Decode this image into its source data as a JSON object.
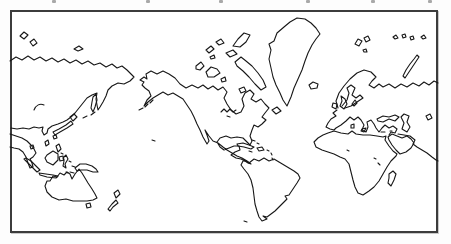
{
  "figure": {
    "background_color": "#fdfdfd",
    "frame": {
      "border_color": "#3c3c3c",
      "fill_color": "#ffffff"
    },
    "top_crop_marks": {
      "comment_color": "#a8a8a8",
      "color": "#a8a8a8",
      "positions_x": [
        52,
        146,
        219,
        306,
        371,
        428
      ]
    },
    "map": {
      "stroke_color": "#171717",
      "stroke_width": 1.1,
      "landmasses": [
        {
          "name": "asia-north-coast-mainland",
          "d": "M 10,61 L 16,57 L 22,60 L 28,56 L 34,60 L 40,57 L 46,61 L 52,58 L 58,62 L 64,59 L 70,63 L 76,60 L 82,64 L 88,61 L 94,65 L 100,63 L 106,67 L 112,64 L 117,68 L 122,66 L 127,70 L 131,74 L 134,77 L 130,81 L 124,84 L 118,83 L 112,86 L 108,90 L 106,96 L 103,102 L 100,107 L 98,110 L 97,105 L 96,99 L 97,93 L 92,95 L 87,98 L 83,103 L 79,108 L 75,113 L 71,117 L 67,120 L 63,122 L 58,124 L 52,126 L 48,129 L 47,133 L 44,135 L 42,131 L 43,127 L 39,128 L 34,127 L 29,129 L 23,128 L 17,129 L 11,128"
        },
        {
          "name": "southeast-asia-coast",
          "d": "M 10,134 L 16,136 L 22,138 L 27,141 L 31,145 L 34,149 L 36,153 L 33,157 L 30,159 L 32,163 L 33,167 L 30,168 L 28,163 L 26,157 L 23,152 L 19,149 L 14,148 L 10,147"
        },
        {
          "name": "wrangel-island-west",
          "d": "M 20,36 L 24,32 L 28,35 L 24,39 Z"
        },
        {
          "name": "wrangel-island-east",
          "d": "M 30,42 L 34,39 L 37,43 L 33,46 Z"
        },
        {
          "name": "new-siberian-islands",
          "d": "M 74,49 L 79,46 L 83,49 L 78,51 Z"
        },
        {
          "name": "lake-baikal",
          "d": "M 34,110 C 36,105 40,103 44,105"
        },
        {
          "name": "sakhalin-island",
          "d": "M 93,97 L 96,94 L 97,100 L 95,107 L 93,112 L 91,108 L 92,102 Z"
        },
        {
          "name": "kuril-islands",
          "d": "M 95,112 L 91,115 M 87,116 L 83,118"
        },
        {
          "name": "japan-hokkaido",
          "d": "M 70,117 L 74,114 L 77,117 L 73,121 Z"
        },
        {
          "name": "japan-honshu",
          "d": "M 71,121 L 73,124 L 67,128 L 60,132 L 55,135 L 53,132 L 59,129 L 66,125 Z"
        },
        {
          "name": "japan-kyushu",
          "d": "M 53,136 L 56,135 L 57,138 L 54,139 Z"
        },
        {
          "name": "taiwan-island",
          "d": "M 45,142 L 48,140 L 49,144 L 46,146 Z"
        },
        {
          "name": "hainan-island",
          "d": "M 30,146 L 33,145 L 34,148 L 31,149 Z"
        },
        {
          "name": "philippines-luzon",
          "d": "M 56,146 L 59,144 L 61,149 L 58,152 Z"
        },
        {
          "name": "philippines-mindanao",
          "d": "M 59,157 L 63,156 L 64,160 L 60,161 Z"
        },
        {
          "name": "philippines-visayas-dot",
          "d": "M 61,153 L 63,154"
        },
        {
          "name": "borneo-island",
          "d": "M 47,155 L 53,151 L 58,154 L 58,160 L 53,165 L 47,162 L 45,158 Z"
        },
        {
          "name": "sumatra-island",
          "d": "M 26,158 L 31,161 L 36,166 L 40,170 L 37,172 L 32,167 L 27,162 L 24,159 Z"
        },
        {
          "name": "java-island",
          "d": "M 39,173 L 46,174 L 53,175 L 58,176 L 56,178 L 47,177 L 40,175 Z"
        },
        {
          "name": "sulawesi-island",
          "d": "M 63,158 L 66,155 L 68,159 L 65,164 L 66,168 L 63,166 L 64,161 Z"
        },
        {
          "name": "moluccas-timor-dots",
          "d": "M 69,161 L 71,162 M 72,166 L 75,167 M 70,172 L 74,173 M 66,172 L 68,173"
        },
        {
          "name": "new-guinea-island",
          "d": "M 75,168 L 80,164 L 86,164 L 92,166 L 96,169 L 98,172 L 93,172 L 87,170 L 81,170 L 77,171 Z"
        },
        {
          "name": "australia",
          "d": "M 50,181 L 53,176 L 57,177 L 60,173 L 64,175 L 67,172 L 70,174 L 72,179 L 75,174 L 79,169 L 82,173 L 85,178 L 88,183 L 92,189 L 95,194 L 97,198 L 93,200 L 87,201 L 80,201 L 73,201 L 66,199 L 59,200 L 52,197 L 47,192 L 45,186 L 47,181 Z"
        },
        {
          "name": "tasmania-island",
          "d": "M 86,204 L 90,203 L 91,207 L 87,208 Z"
        },
        {
          "name": "new-zealand-north-island",
          "d": "M 114,193 L 118,190 L 120,194 L 116,198 Z"
        },
        {
          "name": "new-zealand-south-island",
          "d": "M 108,209 L 112,204 L 116,200 L 118,203 L 113,207 L 110,211 Z"
        },
        {
          "name": "aleutian-islands",
          "d": "M 143,108 L 139,110 M 148,104 L 145,107 M 153,100 L 150,103"
        },
        {
          "name": "hawaii-dots",
          "d": "M 152,140 L 155,141"
        },
        {
          "name": "north-america-mainland",
          "d": "M 140,80 L 144,77 L 147,79 L 146,74 L 151,71 L 157,74 L 163,71 L 169,74 L 175,78 L 180,84 L 186,88 L 192,85 L 198,88 L 203,85 L 208,89 L 213,86 L 218,90 L 223,87 L 227,92 L 224,98 L 227,104 L 231,110 L 236,114 L 241,112 L 244,106 L 242,99 L 245,93 L 250,90 L 254,94 L 251,99 L 256,102 L 261,99 L 265,104 L 269,108 L 265,113 L 262,117 L 266,120 L 262,124 L 258,127 L 254,125 L 252,130 L 250,136 L 252,141 L 250,145 L 246,141 L 243,138 L 237,137 L 231,138 L 226,136 L 220,138 L 217,142 L 220,147 L 224,150 L 229,148 L 234,146 L 239,146 L 240,150 L 235,152 L 231,155 L 236,158 L 241,159 L 245,161 L 248,163 L 251,164 L 247,161 L 242,158 L 237,156 L 232,153 L 227,150 L 223,147 L 218,143 L 213,141 L 209,136 L 205,130 L 207,135 L 209,141 L 207,144 L 203,137 L 200,130 L 197,124 L 194,117 L 191,111 L 187,105 L 183,99 L 178,96 L 173,93 L 168,95 L 163,92 L 158,95 L 153,98 L 148,102 L 144,106 L 147,100 L 151,96 L 149,91 L 145,88 L 142,85 L 144,82 Z"
        },
        {
          "name": "great-lakes",
          "d": "M 221,112 L 224,109 L 227,112 L 230,109 L 233,112 L 236,110 M 227,116 L 230,117"
        },
        {
          "name": "banks-island",
          "d": "M 196,66 L 201,62 L 204,66 L 200,70 L 196,69 Z"
        },
        {
          "name": "victoria-island",
          "d": "M 206,72 L 211,67 L 217,69 L 220,73 L 214,77 L 208,77 Z"
        },
        {
          "name": "king-william-island",
          "d": "M 221,79 L 225,77 L 226,81 L 222,82 Z"
        },
        {
          "name": "southampton-island",
          "d": "M 239,89 L 244,87 L 246,91 L 241,93 Z"
        },
        {
          "name": "baffin-island",
          "d": "M 235,62 L 241,57 L 246,61 L 252,66 L 258,73 L 263,80 L 266,87 L 261,90 L 255,84 L 249,77 L 243,71 L 237,66 Z"
        },
        {
          "name": "devon-island",
          "d": "M 226,53 L 233,50 L 237,54 L 230,57 Z"
        },
        {
          "name": "ellesmere-island",
          "d": "M 233,46 L 238,39 L 244,33 L 250,35 L 246,42 L 240,47 Z"
        },
        {
          "name": "queen-elizabeth-islands",
          "d": "M 206,50 L 211,46 L 214,49 L 209,53 Z M 216,42 L 221,39 L 224,43 L 219,45 Z M 210,57 L 214,55 L 215,58 L 211,59 Z"
        },
        {
          "name": "greenland",
          "d": "M 287,106 L 283,100 L 280,93 L 276,85 L 273,77 L 271,68 L 269,59 L 271,50 L 269,44 L 274,41 L 277,33 L 284,27 L 290,22 L 297,18 L 305,19 L 311,23 L 316,28 L 320,34 L 316,39 L 312,45 L 308,53 L 305,61 L 302,70 L 298,79 L 294,88 L 291,97 Z"
        },
        {
          "name": "iceland",
          "d": "M 309,85 L 313,82 L 318,84 L 317,88 L 311,89 Z"
        },
        {
          "name": "newfoundland-island",
          "d": "M 272,110 L 277,107 L 281,111 L 276,114 Z"
        },
        {
          "name": "cuba",
          "d": "M 237,144 L 243,143 L 249,145 L 254,147 L 251,149 L 244,147 L 238,146 Z"
        },
        {
          "name": "hispaniola",
          "d": "M 257,148 L 262,147 L 264,150 L 259,151 Z"
        },
        {
          "name": "jamaica-dot",
          "d": "M 249,151 L 252,152"
        },
        {
          "name": "bahamas-dots",
          "d": "M 252,140 L 255,141 M 257,143 L 259,144"
        },
        {
          "name": "lesser-antilles-dots",
          "d": "M 267,150 L 269,151 M 271,153 L 272,155 M 272,158 L 273,160"
        },
        {
          "name": "south-america",
          "d": "M 249,163 L 254,159 L 259,161 L 264,158 L 269,161 L 274,159 L 279,162 L 284,165 L 289,168 L 294,171 L 298,174 L 300,178 L 297,183 L 293,189 L 289,195 L 285,196 L 287,199 L 283,203 L 279,207 L 275,211 L 271,214 L 267,217 L 263,216 L 267,219 L 262,221 L 259,217 L 257,211 L 255,204 L 254,196 L 253,188 L 251,180 L 248,174 L 244,169 L 241,165 L 243,161 L 246,161 Z"
        },
        {
          "name": "falkland-dot",
          "d": "M 244,221 L 247,222"
        },
        {
          "name": "svalbard-islands",
          "d": "M 355,44 L 358,39 L 362,41 L 359,46 Z M 364,38 L 368,36 L 370,40 L 366,42 Z M 363,50 L 366,49 L 367,52 L 364,52 Z"
        },
        {
          "name": "franz-josef-land-dots",
          "d": "M 393,37 L 396,35 L 398,38 L 395,39 Z M 402,35 L 405,34 L 406,37 L 403,38 Z M 410,37 L 413,36 L 414,39 L 411,40 Z"
        },
        {
          "name": "severnaya-zemlya-dots",
          "d": "M 421,37 L 424,35 L 426,38 L 423,39 Z"
        },
        {
          "name": "novaya-zemlya",
          "d": "M 403,76 L 406,70 L 410,64 L 414,59 L 417,55 L 419,57 L 415,63 L 411,69 L 407,75 L 405,78 Z"
        },
        {
          "name": "scandinavia-russia-north-coast",
          "d": "M 338,108 L 336,101 L 339,93 L 344,86 L 350,79 L 357,73 L 364,70 L 371,72 L 376,77 L 372,81 L 369,85 L 374,88 L 379,84 L 383,87 L 389,84 L 395,88 L 401,84 L 407,87 L 413,83 L 419,86 L 424,82 L 429,85 L 434,81 L 438,83"
        },
        {
          "name": "baltic-sea",
          "d": "M 342,106 L 347,100 L 349,93 L 347,88 L 351,85 L 355,88 L 352,95 L 356,98 L 360,95 L 363,98 L 357,102 L 351,106 L 345,108"
        },
        {
          "name": "denmark",
          "d": "M 352,104 L 355,100 L 357,103 L 354,106 Z"
        },
        {
          "name": "great-britain-island",
          "d": "M 341,96 L 345,99 L 347,104 L 344,109 L 340,106 L 342,101 Z"
        },
        {
          "name": "ireland-island",
          "d": "M 333,103 L 337,104 L 336,109 L 332,107 Z"
        },
        {
          "name": "europe-mediterranean-coast",
          "d": "M 337,110 L 333,113 L 336,116 L 331,119 L 328,123 L 326,127 L 330,129 L 334,130 L 336,128 L 341,125 L 346,121 L 350,117 L 354,120 L 358,117 L 361,120 L 364,125 L 362,130 L 366,132 L 368,127 L 367,122 L 371,120 L 374,124 L 376,128 L 379,132 L 382,128 L 385,125 L 389,128 L 393,126 L 397,129 L 395,133 L 391,132 L 389,135"
        },
        {
          "name": "corsica-sardinia",
          "d": "M 351,125 L 354,124 L 354,128 L 351,128 Z"
        },
        {
          "name": "sicily",
          "d": "M 362,129 L 366,128 L 364,132 L 361,131 Z"
        },
        {
          "name": "crete-cyprus-dots",
          "d": "M 381,132 L 385,132 M 390,131 L 392,131"
        },
        {
          "name": "black-sea",
          "d": "M 377,119 L 383,116 L 389,117 L 395,115 L 399,117 L 395,121 L 389,119 L 383,122 L 378,121 Z"
        },
        {
          "name": "caspian-sea",
          "d": "M 404,114 L 409,116 L 407,122 L 410,127 L 407,132 L 402,129 L 404,123 L 401,117 Z"
        },
        {
          "name": "aral-sea",
          "d": "M 426,116 L 430,114 L 432,118 L 428,120 Z"
        },
        {
          "name": "africa",
          "d": "M 334,131 L 341,133 L 348,134 L 352,131 L 356,134 L 363,135 L 370,135 L 377,136 L 383,137 L 386,136 L 385,140 L 389,146 L 393,151 L 397,154 L 396,156 L 391,161 L 387,167 L 383,174 L 379,181 L 374,187 L 369,191 L 363,195 L 358,193 L 355,187 L 353,180 L 351,172 L 349,164 L 345,159 L 340,157 L 334,154 L 328,152 L 322,150 L 316,147 L 314,142 L 318,138 L 323,135 L 328,133 Z"
        },
        {
          "name": "africa-lakes-dots",
          "d": "M 378,163 L 380,165 M 347,150 L 349,151 M 374,158 L 376,159"
        },
        {
          "name": "madagascar",
          "d": "M 389,174 L 393,171 L 396,174 L 394,180 L 391,186 L 388,183 L 389,178 Z"
        },
        {
          "name": "arabian-peninsula",
          "d": "M 388,137 L 392,134 L 397,136 L 402,138 L 407,136 L 411,139 L 414,143 L 411,148 L 406,152 L 400,154 L 396,150 L 392,145 L 389,140 Z"
        },
        {
          "name": "iran-india-coast",
          "d": "M 398,134 L 404,135 L 410,136 L 415,140 L 413,144 L 417,147 L 422,150 L 427,153 L 432,157 L 436,160 L 438,161"
        }
      ]
    }
  }
}
